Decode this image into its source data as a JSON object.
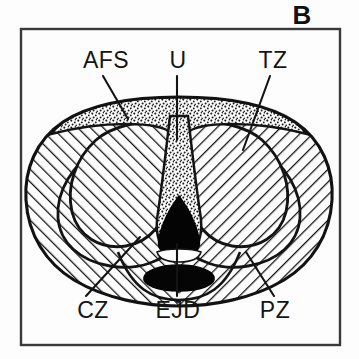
{
  "figure": {
    "panel_letter": "B",
    "title_visible": false,
    "background_color": "#ffffff",
    "ink_color": "#111111",
    "frame": {
      "x": 21,
      "y": 29,
      "width": 319,
      "height": 316,
      "stroke_color": "#3a3a3a"
    }
  },
  "labels": {
    "afs": "AFS",
    "u": "U",
    "tz": "TZ",
    "cz": "CZ",
    "ejd": "EJD",
    "pz": "PZ"
  },
  "label_positions": {
    "afs": {
      "x": 82,
      "y": 68
    },
    "u": {
      "x": 170,
      "y": 68
    },
    "tz": {
      "x": 255,
      "y": 68
    },
    "cz": {
      "x": 72,
      "y": 315
    },
    "ejd": {
      "x": 152,
      "y": 315
    },
    "pz": {
      "x": 258,
      "y": 315
    }
  },
  "zones": [
    {
      "id": "afs",
      "abbr": "AFS",
      "name": "Anterior Fibromuscular Stroma",
      "fill_style": "stipple",
      "fill_color": "#ffffff",
      "pattern": "dotted-stipple"
    },
    {
      "id": "u",
      "abbr": "U",
      "name": "Urethra",
      "fill_style": "stipple-column-and-solid",
      "fill_color": "#000000",
      "pattern": "dotted-stipple"
    },
    {
      "id": "tz",
      "abbr": "TZ",
      "name": "Transition Zone",
      "fill_style": "hatched",
      "fill_color": "#ffffff",
      "pattern": "diagonal-hatch"
    },
    {
      "id": "cz",
      "abbr": "CZ",
      "name": "Central Zone",
      "fill_style": "hatched",
      "fill_color": "#ffffff",
      "pattern": "diagonal-hatch"
    },
    {
      "id": "ejd",
      "abbr": "EJD",
      "name": "Ejaculatory Ducts",
      "fill_style": "solid",
      "fill_color": "#000000",
      "pattern": "solid-black"
    },
    {
      "id": "pz",
      "abbr": "PZ",
      "name": "Peripheral Zone",
      "fill_style": "hatched",
      "fill_color": "#ffffff",
      "pattern": "diagonal-hatch"
    }
  ],
  "leader_lines": [
    {
      "id": "afs-leader",
      "from": "afs",
      "x1": 103,
      "y1": 76,
      "x2": 128,
      "y2": 117
    },
    {
      "id": "u-leader",
      "from": "u",
      "x1": 177,
      "y1": 76,
      "x2": 177,
      "y2": 135
    },
    {
      "id": "tz-leader",
      "from": "tz",
      "x1": 268,
      "y1": 76,
      "x2": 243,
      "y2": 145
    },
    {
      "id": "cz-leader",
      "from": "cz",
      "x1": 88,
      "y1": 296,
      "x2": 135,
      "y2": 240
    },
    {
      "id": "ejd-leader",
      "from": "ejd",
      "x1": 177,
      "y1": 296,
      "x2": 177,
      "y2": 244
    },
    {
      "id": "pz-leader",
      "from": "pz",
      "x1": 272,
      "y1": 296,
      "x2": 248,
      "y2": 254
    }
  ]
}
